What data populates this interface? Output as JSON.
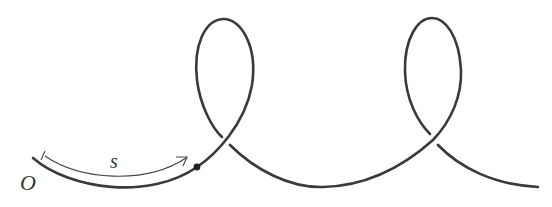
{
  "figure": {
    "type": "curve with loops",
    "labels": {
      "origin": "O",
      "arc_length": "s"
    },
    "features": [
      "origin-point",
      "arc-length-arrow",
      "marked-point",
      "two-loops",
      "over-under-crossings"
    ],
    "colors": {
      "stroke": "#3a3a3a",
      "background": "#ffffff"
    }
  }
}
